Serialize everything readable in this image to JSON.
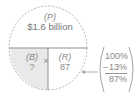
{
  "diagram": {
    "top": {
      "label": "(P)",
      "value": "$1.6 billion"
    },
    "bottom_left": {
      "label": "(B)",
      "value": "?"
    },
    "operator": "×",
    "bottom_right": {
      "label": "(R)",
      "value": "87"
    },
    "calculation": {
      "line1": "100%",
      "minus_sign": "–",
      "line2": "13%",
      "result": "87%"
    },
    "colors": {
      "shaded_quadrant": "#e8e8e8",
      "lines": "#9a9a9a",
      "text": "#8a8a8a"
    }
  }
}
